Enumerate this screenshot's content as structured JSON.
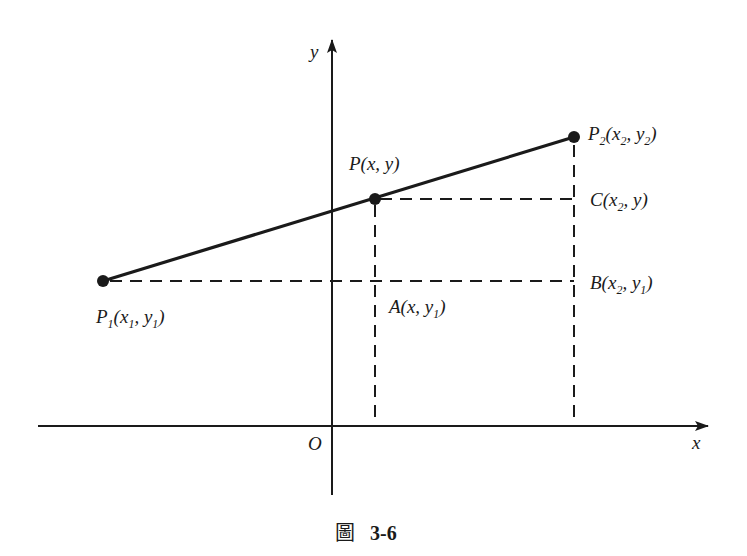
{
  "figure": {
    "caption_prefix": "圖",
    "caption_number": "3-6"
  },
  "axes": {
    "x_label": "x",
    "y_label": "y",
    "origin_label": "O"
  },
  "points": {
    "P1": {
      "name": "P",
      "sub": "1",
      "coords": [
        "x",
        "1",
        "y",
        "1"
      ]
    },
    "P": {
      "name": "P",
      "coords": "(x, y)"
    },
    "P2": {
      "name": "P",
      "sub": "2",
      "coords": [
        "x",
        "2",
        "y",
        "2"
      ]
    },
    "A": {
      "name": "A",
      "coords_pre": "(x, y",
      "sub": "1",
      "coords_post": ")"
    },
    "B": {
      "name": "B",
      "x_sub": "2",
      "y_sub": "1"
    },
    "C": {
      "name": "C",
      "x_sub": "2",
      "y": "y"
    }
  },
  "colors": {
    "ink": "#1a1a1a",
    "background": "#ffffff"
  }
}
